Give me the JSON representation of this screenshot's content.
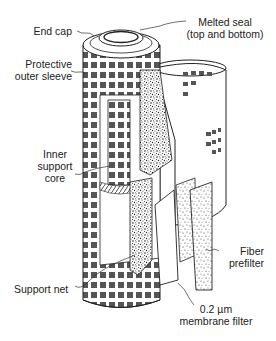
{
  "diagram": {
    "type": "cutaway illustration",
    "labels": {
      "end_cap": "End cap",
      "melted_seal_1": "Melted seal",
      "melted_seal_2": "(top and bottom)",
      "outer_sleeve_1": "Protective",
      "outer_sleeve_2": "outer sleeve",
      "inner_core_1": "Inner",
      "inner_core_2": "support",
      "inner_core_3": "core",
      "support_net": "Support net",
      "prefilter_1": "Fiber",
      "prefilter_2": "prefilter",
      "membrane_1": "0.2 µm",
      "membrane_2": "membrane filter"
    },
    "colors": {
      "line": "#222222",
      "window": "#555555",
      "speckle": "#333333",
      "background": "#ffffff"
    }
  }
}
